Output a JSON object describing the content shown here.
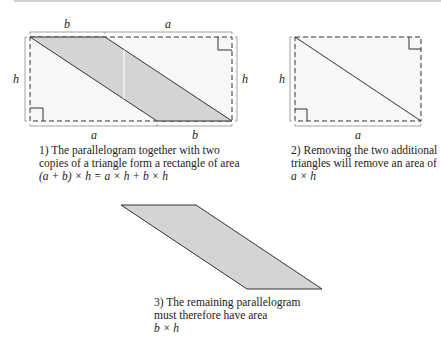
{
  "figure1": {
    "labels": {
      "top_left": "b",
      "top_right": "a",
      "left": "h",
      "right": "h",
      "bottom_left": "a",
      "bottom_right": "b"
    },
    "caption": {
      "line1": "1) The parallelogram together with two",
      "line2": "copies of a triangle form a rectangle of area",
      "formula": "(a + b) × h = a × h + b × h"
    }
  },
  "figure2": {
    "labels": {
      "left": "h",
      "bottom": "a"
    },
    "caption": {
      "line1": "2) Removing the two additional",
      "line2": "triangles will remove an area of",
      "formula": "a × h"
    }
  },
  "figure3": {
    "caption": {
      "line1": "3) The remaining parallelogram",
      "line2": "must therefore have area",
      "formula": "b × h"
    }
  },
  "colors": {
    "fill_gray": "#d4d4d4",
    "rect_fill": "#f7f7f7",
    "stroke": "#333333"
  }
}
